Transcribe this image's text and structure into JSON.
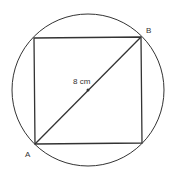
{
  "diagram": {
    "labels": {
      "vertex_a": "A",
      "vertex_b": "B",
      "diagonal_length": "8 cm"
    },
    "colors": {
      "stroke": "#333333",
      "background": "#ffffff"
    }
  }
}
